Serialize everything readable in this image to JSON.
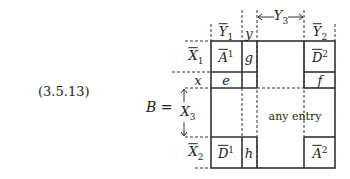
{
  "equation_number": "(3.5.13)",
  "lhs": {
    "symbol": "B",
    "equals": "="
  },
  "column_labels": {
    "Y1": {
      "base": "Y",
      "sub": "1",
      "overline": true
    },
    "y": {
      "base": "y"
    },
    "Y3": {
      "base": "Y",
      "sub": "3",
      "arrow": "double"
    },
    "Y2": {
      "base": "Y",
      "sub": "2",
      "overline": true
    }
  },
  "row_labels": {
    "X1": {
      "base": "X",
      "sub": "1",
      "overline": true
    },
    "x": {
      "base": "x"
    },
    "X3": {
      "base": "X",
      "sub": "3",
      "arrow": "double"
    },
    "X2": {
      "base": "X",
      "sub": "2",
      "overline": true
    }
  },
  "cells": {
    "A1": {
      "base": "A",
      "sup": "1",
      "overline": true
    },
    "g": {
      "base": "g"
    },
    "D2": {
      "base": "D",
      "sup": "2",
      "overline": true
    },
    "e": {
      "base": "e"
    },
    "f": {
      "base": "f"
    },
    "any": {
      "text": "any entry"
    },
    "D1": {
      "base": "D",
      "sup": "1",
      "overline": true
    },
    "h": {
      "base": "h"
    },
    "A2": {
      "base": "A",
      "sup": "2",
      "overline": true
    }
  }
}
